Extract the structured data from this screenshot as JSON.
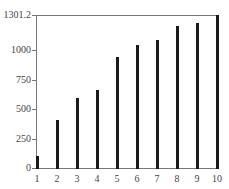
{
  "chart_data": {
    "type": "bar",
    "title": "",
    "xlabel": "",
    "ylabel": "",
    "categories": [
      "1",
      "2",
      "3",
      "4",
      "5",
      "6",
      "7",
      "8",
      "9",
      "10"
    ],
    "values": [
      100,
      405,
      595,
      665,
      945,
      1045,
      1090,
      1205,
      1235,
      1301.2
    ],
    "ylim": [
      0,
      1301.2
    ],
    "xlim": [
      1,
      10
    ],
    "yticks": [
      0,
      250,
      500,
      750,
      1000,
      1301.2
    ],
    "ytick_labels": [
      "0",
      "250",
      "500",
      "750",
      "1000",
      "1301.2"
    ],
    "xtick_labels": [
      "1",
      "2",
      "3",
      "4",
      "5",
      "6",
      "7",
      "8",
      "9",
      "10"
    ],
    "grid": false,
    "legend": null,
    "bar_color": "#1a1a1a",
    "frame_color": "#777777"
  }
}
